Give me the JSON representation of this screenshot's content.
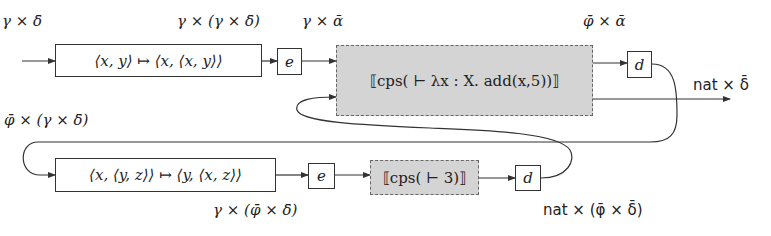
{
  "diagram": {
    "top_row": {
      "input_label": "γ × δ̄",
      "swap_box": "⟨x, y⟩ ↦ ⟨x, ⟨x, y⟩⟩",
      "after_swap_label": "γ × (γ × δ̄)",
      "e_box": "e",
      "after_e_label": "γ × ᾱ",
      "cps_box": "⟦cps( ⊢ λx : X. add(x,5))⟧",
      "output_label_1": "φ̄ × ᾱ",
      "d_box": "d",
      "output_label_2": "nat × δ̄"
    },
    "bottom_row": {
      "input_label": "φ̄ × (γ × δ̄)",
      "swap_box": "⟨x, ⟨y, z⟩⟩ ↦ ⟨y, ⟨x, z⟩⟩",
      "after_swap_label": "γ × (φ̄ × δ̄)",
      "e_box": "e",
      "cps_box": "⟦cps( ⊢ 3)⟧",
      "d_box": "d",
      "output_label": "nat × (φ̄ × δ̄)"
    },
    "colors": {
      "stroke": "#333333",
      "cps_fill": "#d4d4d4",
      "cps_border": "#666666"
    }
  }
}
